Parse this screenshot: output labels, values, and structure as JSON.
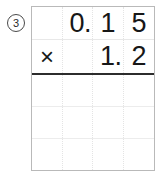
{
  "problem": {
    "number_label": "3",
    "operation": "multiplication",
    "operator_symbol": "×",
    "multiplicand": "0.15",
    "multiplier": "1.2",
    "answer": "",
    "rows": [
      {
        "name": "multiplicand-row",
        "cells": [
          "",
          "0.",
          "1",
          "5"
        ]
      },
      {
        "name": "multiplier-row",
        "cells": [
          "×",
          "",
          "1.",
          "2"
        ]
      },
      {
        "name": "work-row-1",
        "cells": [
          "",
          "",
          "",
          ""
        ]
      },
      {
        "name": "work-row-2",
        "cells": [
          "",
          "",
          "",
          ""
        ]
      },
      {
        "name": "answer-row",
        "cells": [
          "",
          "",
          "",
          ""
        ]
      }
    ]
  },
  "colors": {
    "ink": "#171717",
    "grid_line": "#e8e8e8",
    "grid_border": "#b9b9b9",
    "rule": "#2c2c2c"
  }
}
